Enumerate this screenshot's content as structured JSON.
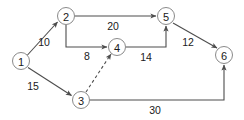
{
  "diagram": {
    "type": "directed-weighted-graph",
    "canvas": {
      "width": 244,
      "height": 120,
      "background": "#ffffff"
    },
    "style": {
      "node_fill": "#ffffff",
      "node_stroke": "#8a8a8a",
      "edge_color": "#4d4d4d",
      "text_color": "#1a1a1a",
      "node_radius": 8.5
    },
    "nodes": [
      {
        "id": "1",
        "label": "1",
        "cx": 21,
        "cy": 61
      },
      {
        "id": "2",
        "label": "2",
        "cx": 66,
        "cy": 16
      },
      {
        "id": "3",
        "label": "3",
        "cx": 81,
        "cy": 100
      },
      {
        "id": "4",
        "label": "4",
        "cx": 117,
        "cy": 47
      },
      {
        "id": "5",
        "label": "5",
        "cx": 166,
        "cy": 16
      },
      {
        "id": "6",
        "label": "6",
        "cx": 224,
        "cy": 55
      }
    ],
    "edges": [
      {
        "id": "e1-2",
        "from": "1",
        "to": "2",
        "weight": "10",
        "dashed": false,
        "arrow": true,
        "path": "M 27.5 55 L 57.5 22",
        "label_x": 44,
        "label_y": 42
      },
      {
        "id": "e1-3",
        "from": "1",
        "to": "3",
        "weight": "15",
        "dashed": false,
        "arrow": true,
        "path": "M 28 67.5 L 71.5 95.5",
        "label_x": 33,
        "label_y": 86
      },
      {
        "id": "e2-5",
        "from": "2",
        "to": "5",
        "weight": "20",
        "dashed": false,
        "arrow": true,
        "path": "M 75 16 L 156 16",
        "label_x": 113,
        "label_y": 26
      },
      {
        "id": "e2-4",
        "from": "2",
        "to": "4",
        "weight": "8",
        "dashed": false,
        "arrow": true,
        "path": "M 66 25 L 66 47 L 107 47",
        "label_x": 87,
        "label_y": 56
      },
      {
        "id": "e3-4",
        "from": "3",
        "to": "4",
        "weight": "",
        "dashed": true,
        "arrow": true,
        "path": "M 86 92 L 111 54",
        "label_x": null,
        "label_y": null
      },
      {
        "id": "e4-5",
        "from": "4",
        "to": "5",
        "weight": "14",
        "dashed": false,
        "arrow": true,
        "path": "M 126 47 L 166 47 L 166 26",
        "label_x": 146,
        "label_y": 57
      },
      {
        "id": "e5-6",
        "from": "5",
        "to": "6",
        "weight": "12",
        "dashed": false,
        "arrow": true,
        "path": "M 173 23 L 217 48",
        "label_x": 188,
        "label_y": 42
      },
      {
        "id": "e3-6",
        "from": "3",
        "to": "6",
        "weight": "30",
        "dashed": false,
        "arrow": true,
        "path": "M 90 100 L 224 100 L 224 65",
        "label_x": 155,
        "label_y": 110
      }
    ]
  }
}
